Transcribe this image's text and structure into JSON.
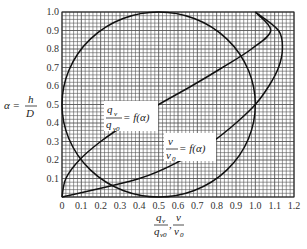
{
  "chart_data": {
    "type": "line",
    "title": "",
    "xlabel": "q_v/q_v0 , v/v_0",
    "ylabel": "α = h/D",
    "xlim": [
      0,
      1.2
    ],
    "ylim": [
      0,
      1.0
    ],
    "grid": true,
    "x_ticks": [
      "0",
      "0.1",
      "0.2",
      "0.3",
      "0.4",
      "0.5",
      "0.6",
      "0.7",
      "0.8",
      "0.9",
      "1.0",
      "1.1",
      "1.2"
    ],
    "y_ticks": [
      "0",
      "0.1",
      "0.2",
      "0.3",
      "0.4",
      "0.5",
      "0.6",
      "0.7",
      "0.8",
      "0.9",
      "1.0"
    ],
    "annotations": [
      "q_v/q_v0 = f(α)",
      "v/v_0 = f(α)"
    ],
    "series": [
      {
        "name": "q_v/q_v0 = f(α)",
        "points": [
          [
            0,
            0
          ],
          [
            0.02,
            0.1
          ],
          [
            0.09,
            0.2
          ],
          [
            0.2,
            0.3
          ],
          [
            0.34,
            0.4
          ],
          [
            0.5,
            0.5
          ],
          [
            0.67,
            0.6
          ],
          [
            0.83,
            0.7
          ],
          [
            0.98,
            0.8
          ],
          [
            1.08,
            0.9
          ],
          [
            1.0,
            1.0
          ]
        ]
      },
      {
        "name": "v/v_0 = f(α)",
        "points": [
          [
            0,
            0
          ],
          [
            0.4,
            0.1
          ],
          [
            0.62,
            0.2
          ],
          [
            0.78,
            0.3
          ],
          [
            0.9,
            0.4
          ],
          [
            1.0,
            0.5
          ],
          [
            1.07,
            0.6
          ],
          [
            1.12,
            0.7
          ],
          [
            1.14,
            0.8
          ],
          [
            1.12,
            0.9
          ],
          [
            1.0,
            1.0
          ]
        ]
      },
      {
        "name": "circle",
        "center": [
          0.5,
          0.5
        ],
        "radius": 0.5
      }
    ]
  },
  "axes": {
    "ylabel_alpha": "α =",
    "ylabel_num": "h",
    "ylabel_den": "D",
    "xlabel_num1": "q",
    "xlabel_sub1": "v",
    "xlabel_den1": "q",
    "xlabel_densub1": "v0",
    "xlabel_num2": "v",
    "xlabel_den2": "v",
    "xlabel_densub2": "0"
  }
}
